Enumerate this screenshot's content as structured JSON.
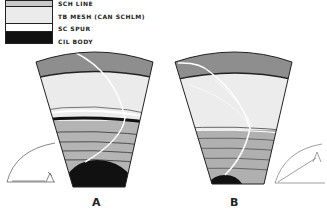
{
  "legend": {
    "items": [
      {
        "label": "SCH LINE",
        "fill": "#c8c8c8"
      },
      {
        "label": "TB MESH (CAN SCHLM)",
        "fill": "#ebebeb"
      },
      {
        "label": "SC SPUR",
        "fill": "#ffffff"
      },
      {
        "label": "CIL BODY",
        "fill": "#111111"
      }
    ]
  },
  "panels": [
    {
      "caption": "A"
    },
    {
      "caption": "B"
    }
  ]
}
